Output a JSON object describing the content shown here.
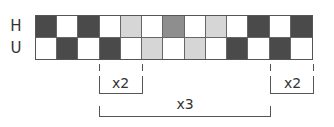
{
  "rows": [
    {
      "label": "H",
      "cells": [
        "dark",
        "white",
        "dark",
        "white",
        "light",
        "white",
        "medium",
        "white",
        "light",
        "white",
        "dark",
        "white",
        "dark"
      ]
    },
    {
      "label": "U",
      "cells": [
        "white",
        "dark",
        "white",
        "dark",
        "white",
        "light",
        "white",
        "light",
        "white",
        "dark",
        "white",
        "dark",
        "white"
      ]
    }
  ],
  "colors": {
    "dark": "#4a4a4a",
    "medium": "#8e8e8e",
    "light": "#d6d6d6",
    "white": "#ffffff"
  },
  "brackets": [
    {
      "label": "x2",
      "start_col": 3,
      "end_col": 5,
      "level": 1
    },
    {
      "label": "x2",
      "start_col": 11,
      "end_col": 13,
      "level": 1
    },
    {
      "label": "x3",
      "start_col": 3,
      "end_col": 11,
      "level": 2
    }
  ]
}
